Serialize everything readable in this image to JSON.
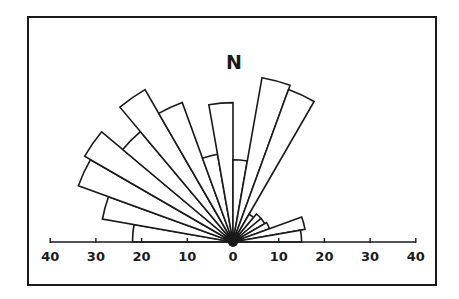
{
  "chart_data": {
    "type": "rose",
    "subtype": "half-circle rose diagram (orientation frequency)",
    "title": "",
    "north_label": "N",
    "sector_width_deg": 10,
    "bearing_range": [
      270,
      90
    ],
    "radial_axis": {
      "ticks_left": [
        "40",
        "30",
        "20",
        "10",
        "0"
      ],
      "ticks_right": [
        "10",
        "20",
        "30",
        "40"
      ],
      "max": 40,
      "tick_values": [
        -40,
        -30,
        -20,
        -10,
        0,
        10,
        20,
        30,
        40
      ]
    },
    "sectors": [
      {
        "from": 270,
        "to": 280,
        "value": 22
      },
      {
        "from": 280,
        "to": 290,
        "value": 29
      },
      {
        "from": 290,
        "to": 300,
        "value": 36
      },
      {
        "from": 300,
        "to": 310,
        "value": 37.5
      },
      {
        "from": 310,
        "to": 320,
        "value": 31.5
      },
      {
        "from": 320,
        "to": 330,
        "value": 38.5
      },
      {
        "from": 330,
        "to": 340,
        "value": 32.5
      },
      {
        "from": 340,
        "to": 350,
        "value": 19.5
      },
      {
        "from": 350,
        "to": 360,
        "value": 30.5
      },
      {
        "from": 0,
        "to": 10,
        "value": 18
      },
      {
        "from": 10,
        "to": 20,
        "value": 36.5
      },
      {
        "from": 20,
        "to": 30,
        "value": 35.5
      },
      {
        "from": 30,
        "to": 40,
        "value": 7
      },
      {
        "from": 40,
        "to": 50,
        "value": 8
      },
      {
        "from": 50,
        "to": 60,
        "value": 8
      },
      {
        "from": 60,
        "to": 70,
        "value": 8.5
      },
      {
        "from": 70,
        "to": 80,
        "value": 16
      },
      {
        "from": 80,
        "to": 90,
        "value": 15
      }
    ],
    "grid": false,
    "legend": null
  },
  "layout": {
    "frame": {
      "x": 28,
      "y": 17,
      "w": 408,
      "h": 268
    },
    "center": {
      "x": 233,
      "y": 242
    },
    "px_per_unit": 4.57,
    "north_label_pos": {
      "x": 234,
      "y": 69
    },
    "tick_label_y": 261,
    "colors": {
      "ink": "#1a1a1a",
      "background": "#ffffff"
    }
  }
}
